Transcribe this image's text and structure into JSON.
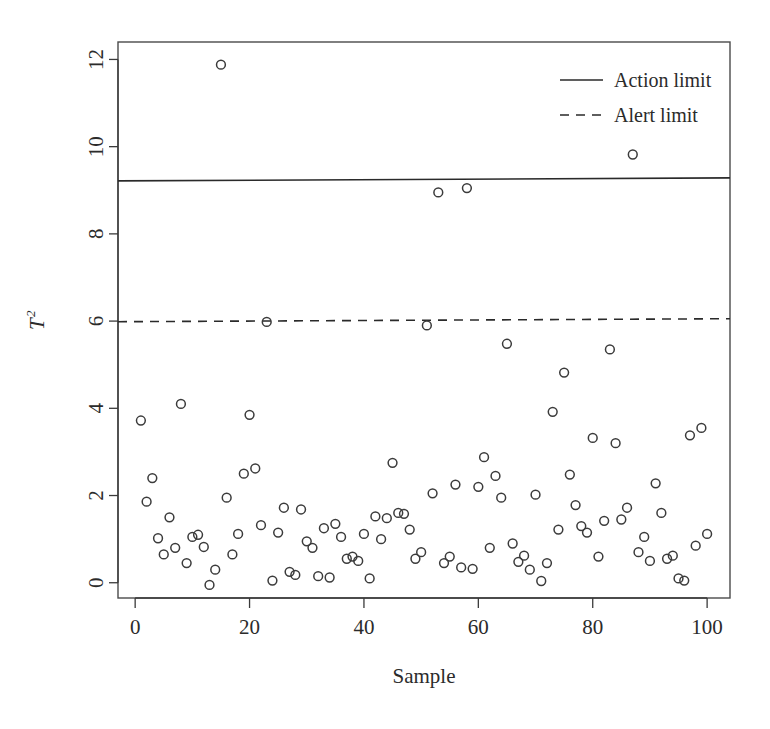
{
  "chart_data": {
    "type": "scatter",
    "title": "",
    "xlabel": "Sample",
    "ylabel": "T2",
    "ylabel_base": "T",
    "ylabel_sup": "2",
    "xlim": [
      -3,
      104
    ],
    "ylim": [
      -0.35,
      12.4
    ],
    "xticks": [
      0,
      20,
      40,
      60,
      80,
      100
    ],
    "yticks": [
      0,
      2,
      4,
      6,
      8,
      10,
      12
    ],
    "grid": false,
    "legend_position": "top-right",
    "legend": [
      {
        "label": "Action limit",
        "style": "solid"
      },
      {
        "label": "Alert limit",
        "style": "dashed"
      }
    ],
    "reference_lines": [
      {
        "name": "Action limit",
        "value": 9.25,
        "style": "solid"
      },
      {
        "name": "Alert limit",
        "value": 6.02,
        "style": "dashed"
      }
    ],
    "series": [
      {
        "name": "T2 statistic",
        "marker": "open-circle",
        "x": [
          1,
          2,
          3,
          4,
          5,
          6,
          7,
          8,
          9,
          10,
          11,
          12,
          13,
          14,
          15,
          16,
          17,
          18,
          19,
          20,
          21,
          22,
          23,
          24,
          25,
          26,
          27,
          28,
          29,
          30,
          31,
          32,
          33,
          34,
          35,
          36,
          37,
          38,
          39,
          40,
          41,
          42,
          43,
          44,
          45,
          46,
          47,
          48,
          49,
          50,
          51,
          52,
          53,
          54,
          55,
          56,
          57,
          58,
          59,
          60,
          61,
          62,
          63,
          64,
          65,
          66,
          67,
          68,
          69,
          70,
          71,
          72,
          73,
          74,
          75,
          76,
          77,
          78,
          79,
          80,
          81,
          82,
          83,
          84,
          85,
          86,
          87,
          88,
          89,
          90,
          91,
          92,
          93,
          94,
          95,
          96,
          97,
          98,
          99,
          100
        ],
        "y": [
          3.72,
          1.86,
          2.4,
          1.02,
          0.65,
          1.5,
          0.8,
          4.1,
          0.45,
          1.05,
          1.1,
          0.82,
          -0.05,
          0.3,
          11.88,
          1.95,
          0.65,
          1.12,
          2.5,
          3.85,
          2.62,
          1.32,
          5.98,
          0.05,
          1.15,
          1.72,
          0.25,
          0.18,
          1.68,
          0.95,
          0.8,
          0.15,
          1.25,
          0.12,
          1.35,
          1.05,
          0.55,
          0.6,
          0.5,
          1.12,
          0.1,
          1.52,
          1.0,
          1.48,
          2.75,
          1.6,
          1.58,
          1.22,
          0.55,
          0.7,
          5.9,
          2.05,
          8.95,
          0.45,
          0.6,
          2.25,
          0.35,
          9.05,
          0.32,
          2.2,
          2.88,
          0.8,
          2.45,
          1.95,
          5.48,
          0.9,
          0.48,
          0.62,
          0.3,
          2.02,
          0.04,
          0.45,
          3.92,
          1.22,
          4.82,
          2.48,
          1.78,
          1.3,
          1.15,
          3.32,
          0.6,
          1.42,
          5.35,
          3.2,
          1.45,
          1.72,
          9.82,
          0.7,
          1.05,
          0.5,
          2.28,
          1.6,
          0.55,
          0.62,
          0.1,
          0.05,
          3.38,
          0.85,
          3.55,
          1.12
        ]
      }
    ]
  }
}
